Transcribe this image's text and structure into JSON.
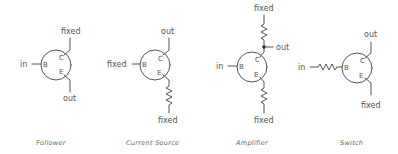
{
  "diagrams": [
    {
      "name": "follower",
      "caption": "Follower",
      "base": "in",
      "collector": "fixed",
      "emitter": "out",
      "pins": {
        "b": "B",
        "c": "C",
        "e": "E"
      }
    },
    {
      "name": "current-source",
      "caption": "Current Source",
      "base": "fixed",
      "collector": "out",
      "emitter": "fixed",
      "emitter_resistor": true,
      "pins": {
        "b": "B",
        "c": "C",
        "e": "E"
      }
    },
    {
      "name": "amplifier",
      "caption": "Amplifier",
      "base": "in",
      "collector_top": "fixed",
      "collector_out": "out",
      "emitter": "fixed",
      "collector_resistor": true,
      "emitter_resistor": true,
      "pins": {
        "b": "B",
        "c": "C",
        "e": "E"
      }
    },
    {
      "name": "switch",
      "caption": "Switch",
      "base": "in",
      "base_resistor": true,
      "collector": "out",
      "emitter": "fixed",
      "pins": {
        "b": "B",
        "c": "C",
        "e": "E"
      }
    }
  ]
}
